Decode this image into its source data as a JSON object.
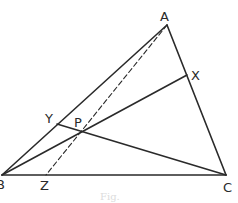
{
  "figure": {
    "stroke_color": "#2a2a2a",
    "background": "#ffffff",
    "points": {
      "A": {
        "label": "A",
        "x": 167,
        "y": 25,
        "lx": 160,
        "ly": 21
      },
      "B": {
        "label": "B",
        "x": 2,
        "y": 175,
        "lx": -4,
        "ly": 189
      },
      "C": {
        "label": "C",
        "x": 226,
        "y": 175,
        "lx": 223,
        "ly": 192
      },
      "X": {
        "label": "X",
        "x": 187,
        "y": 75,
        "lx": 191,
        "ly": 80
      },
      "Y": {
        "label": "Y",
        "x": 57,
        "y": 124,
        "lx": 45,
        "ly": 123
      },
      "P": {
        "label": "P",
        "x": 80,
        "y": 131,
        "lx": 74,
        "ly": 127
      },
      "Z": {
        "label": "Z",
        "x": 46,
        "y": 175,
        "lx": 40,
        "ly": 190
      }
    },
    "segments": [
      {
        "from": "A",
        "to": "B",
        "style": "solid"
      },
      {
        "from": "B",
        "to": "C",
        "style": "solid"
      },
      {
        "from": "C",
        "to": "A",
        "style": "solid"
      },
      {
        "from": "B",
        "to": "X",
        "style": "solid"
      },
      {
        "from": "C",
        "to": "Y",
        "style": "solid"
      },
      {
        "from": "A",
        "to": "Z",
        "style": "dashed"
      }
    ],
    "caption": "Fig."
  }
}
